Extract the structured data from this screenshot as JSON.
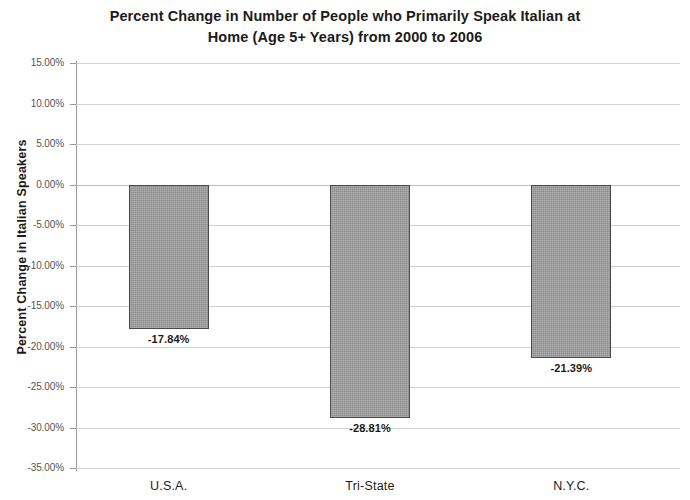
{
  "chart_data": {
    "type": "bar",
    "title": "Percent Change in Number of People who Primarily Speak Italian at Home (Age 5+ Years) from 2000 to 2006",
    "title_line1": "Percent Change in Number of People who Primarily Speak Italian at",
    "title_line2": "Home (Age 5+ Years) from 2000 to 2006",
    "xlabel": "",
    "ylabel": "Percent Change in Italian Speakers",
    "categories": [
      "U.S.A.",
      "Tri-State",
      "N.Y.C."
    ],
    "values": [
      -17.84,
      -28.81,
      -21.39
    ],
    "value_labels": [
      "-17.84%",
      "-28.81%",
      "-21.39%"
    ],
    "ylim": [
      -35,
      15
    ],
    "ytick_values": [
      15,
      10,
      5,
      0,
      -5,
      -10,
      -15,
      -20,
      -25,
      -30,
      -35
    ],
    "ytick_labels": [
      "15.00%",
      "10.00%",
      "5.00%",
      "0.00%",
      "-5.00%",
      "-10.00%",
      "-15.00%",
      "-20.00%",
      "-25.00%",
      "-30.00%",
      "-35.00%"
    ],
    "grid": true,
    "legend": false,
    "bar_color": "#9d9d9d",
    "bar_border_color": "#4a4a4a",
    "gridline_color": "#c8c8c8",
    "text_color": "#1b1b1b"
  }
}
